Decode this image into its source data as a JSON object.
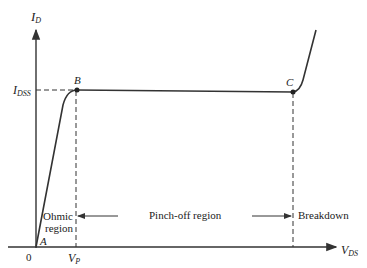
{
  "diagram": {
    "axes": {
      "y_label_main": "I",
      "y_label_sub": "D",
      "x_label_main": "V",
      "x_label_sub": "DS",
      "origin_label": "0"
    },
    "levels": {
      "idss_main": "I",
      "idss_sub": "DSS",
      "vp_main": "V",
      "vp_sub": "P"
    },
    "points": {
      "a": "A",
      "b": "B",
      "c": "C"
    },
    "regions": {
      "ohmic_line1": "Ohmic",
      "ohmic_line2": "region",
      "pinchoff": "Pinch-off region",
      "breakdown": "Breakdown"
    },
    "colors": {
      "line": "#333333",
      "background": "#ffffff"
    }
  }
}
